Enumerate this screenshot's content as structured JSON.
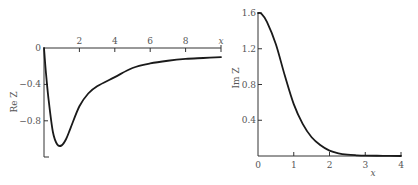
{
  "chart_data": [
    {
      "type": "line",
      "title": "",
      "xlabel": "x",
      "ylabel": "Re Z",
      "xlim": [
        0,
        10
      ],
      "ylim": [
        -1.2,
        0
      ],
      "grid": false,
      "x_ticks": [
        "2",
        "4",
        "6",
        "8"
      ],
      "x_tick_values": [
        2,
        4,
        6,
        8
      ],
      "y_ticks": [
        "0",
        "−0.4",
        "−0.8"
      ],
      "y_tick_values": [
        0,
        -0.4,
        -0.8
      ],
      "series": [
        {
          "name": "Re Z",
          "x": [
            0,
            0.1,
            0.25,
            0.5,
            0.75,
            1.0,
            1.25,
            1.5,
            2.0,
            2.5,
            3.0,
            4.0,
            5.0,
            6.0,
            7.0,
            8.0,
            9.0,
            10.0
          ],
          "y": [
            0,
            -0.25,
            -0.55,
            -0.92,
            -1.06,
            -1.07,
            -1.0,
            -0.88,
            -0.64,
            -0.5,
            -0.42,
            -0.32,
            -0.22,
            -0.17,
            -0.14,
            -0.12,
            -0.11,
            -0.1
          ]
        }
      ]
    },
    {
      "type": "line",
      "title": "",
      "xlabel": "x",
      "ylabel": "Im Z",
      "xlim": [
        0,
        4
      ],
      "ylim": [
        0,
        1.6
      ],
      "grid": false,
      "x_ticks": [
        "0",
        "1",
        "2",
        "3",
        "4"
      ],
      "x_tick_values": [
        0,
        1,
        2,
        3,
        4
      ],
      "y_ticks": [
        "1.6",
        "1.2",
        "0.8",
        "0.4"
      ],
      "y_tick_values": [
        1.6,
        1.2,
        0.8,
        0.4
      ],
      "series": [
        {
          "name": "Im Z",
          "x": [
            0,
            0.1,
            0.25,
            0.5,
            0.75,
            1.0,
            1.25,
            1.5,
            1.75,
            2.0,
            2.25,
            2.5,
            2.75,
            3.0,
            3.5,
            4.0
          ],
          "y": [
            1.6,
            1.59,
            1.5,
            1.25,
            0.9,
            0.58,
            0.36,
            0.21,
            0.12,
            0.06,
            0.03,
            0.015,
            0.008,
            0.004,
            0.002,
            0.0
          ]
        }
      ]
    }
  ],
  "left": {
    "ylabel": "Re Z",
    "xlabel": "x"
  },
  "right": {
    "ylabel": "Im Z",
    "xlabel": "x"
  }
}
